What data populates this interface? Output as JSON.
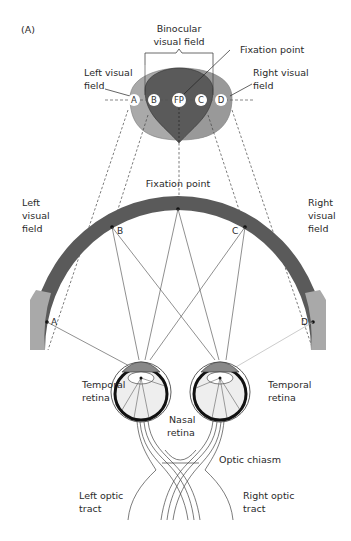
{
  "figure": {
    "panel_label": "(A)",
    "top_diagram": {
      "binocular_label_line1": "Binocular",
      "binocular_label_line2": "visual field",
      "fixation_label": "Fixation point",
      "left_field_line1": "Left visual",
      "left_field_line2": "field",
      "right_field_line1": "Right visual",
      "right_field_line2": "field",
      "points": [
        "A",
        "B",
        "FP",
        "C",
        "D"
      ]
    },
    "arc_diagram": {
      "fixation_label": "Fixation point",
      "left_field_line1": "Left",
      "left_field_line2": "visual",
      "left_field_line3": "field",
      "right_field_line1": "Right",
      "right_field_line2": "visual",
      "right_field_line3": "field",
      "point_a": "A",
      "point_b": "B",
      "point_c": "C",
      "point_d": "D"
    },
    "eyes": {
      "temporal_left_line1": "Temporal",
      "temporal_left_line2": "retina",
      "temporal_right_line1": "Temporal",
      "temporal_right_line2": "retina",
      "nasal_line1": "Nasal",
      "nasal_line2": "retina",
      "chiasm": "Optic chiasm",
      "left_tract_line1": "Left optic",
      "left_tract_line2": "tract",
      "right_tract_line1": "Right optic",
      "right_tract_line2": "tract"
    },
    "colors": {
      "dark_field": "#5a5a5a",
      "light_field": "#a9a9a9",
      "mid_field": "#8a8a8a"
    }
  }
}
